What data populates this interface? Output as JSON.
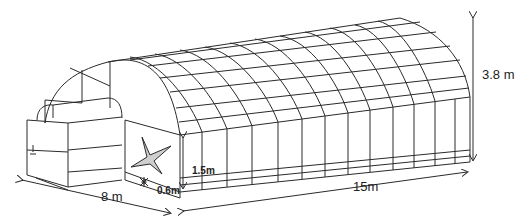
{
  "diagram": {
    "colors": {
      "line": "#2a2a2a",
      "star_fill": "#cfcfcf",
      "background": "#ffffff"
    },
    "dimensions": {
      "height": "3.8 m",
      "width": "8 m",
      "length": "15m",
      "sidewall_height": "1.5m",
      "base_height": "0.6m"
    },
    "symbols": [
      {
        "name": "star-marker",
        "description": "four-pointed star on front gable wall"
      },
      {
        "name": "fan-symbol",
        "description": "small ventilation fan symbol near base"
      },
      {
        "name": "door-handle",
        "description": "small mark on vestibule door"
      }
    ]
  }
}
